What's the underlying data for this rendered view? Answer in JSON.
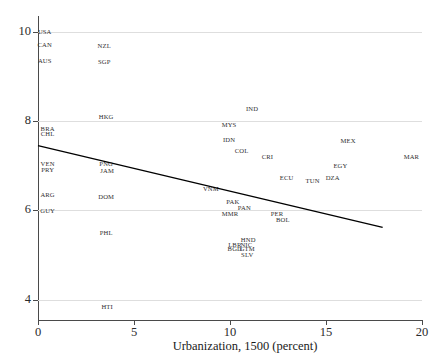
{
  "chart_data": {
    "type": "scatter",
    "title": "",
    "xlabel": "Urbanization, 1500 (percent)",
    "ylabel": "",
    "xlim": [
      0,
      20
    ],
    "ylim": [
      3.55,
      10.35
    ],
    "xticks": [
      0,
      5,
      10,
      15,
      20
    ],
    "yticks": [
      4,
      6,
      8,
      10
    ],
    "grid": true,
    "legend": "none",
    "point_label_field": "country_code",
    "points": [
      {
        "label": "USA",
        "x": 0.35,
        "y": 10.0
      },
      {
        "label": "CAN",
        "x": 0.35,
        "y": 9.7
      },
      {
        "label": "NZL",
        "x": 3.45,
        "y": 9.68
      },
      {
        "label": "AUS",
        "x": 0.35,
        "y": 9.35
      },
      {
        "label": "SGP",
        "x": 3.45,
        "y": 9.33
      },
      {
        "label": "IND",
        "x": 11.15,
        "y": 8.27
      },
      {
        "label": "HKG",
        "x": 3.55,
        "y": 8.1
      },
      {
        "label": "MYS",
        "x": 9.95,
        "y": 7.92
      },
      {
        "label": "BRA",
        "x": 0.5,
        "y": 7.83
      },
      {
        "label": "CHL",
        "x": 0.5,
        "y": 7.72
      },
      {
        "label": "IDN",
        "x": 9.95,
        "y": 7.58
      },
      {
        "label": "MEX",
        "x": 16.15,
        "y": 7.55
      },
      {
        "label": "COL",
        "x": 10.6,
        "y": 7.33
      },
      {
        "label": "CRI",
        "x": 11.95,
        "y": 7.2
      },
      {
        "label": "MAR",
        "x": 19.45,
        "y": 7.2
      },
      {
        "label": "VEN",
        "x": 0.5,
        "y": 7.05
      },
      {
        "label": "PNG",
        "x": 3.55,
        "y": 7.05
      },
      {
        "label": "EGY",
        "x": 15.75,
        "y": 7.0
      },
      {
        "label": "PRY",
        "x": 0.5,
        "y": 6.9
      },
      {
        "label": "JAM",
        "x": 3.6,
        "y": 6.88
      },
      {
        "label": "ECU",
        "x": 12.95,
        "y": 6.72
      },
      {
        "label": "DZA",
        "x": 15.35,
        "y": 6.72
      },
      {
        "label": "TUN",
        "x": 14.3,
        "y": 6.65
      },
      {
        "label": "VNM",
        "x": 9.0,
        "y": 6.47
      },
      {
        "label": "ARG",
        "x": 0.5,
        "y": 6.35
      },
      {
        "label": "DOM",
        "x": 3.55,
        "y": 6.3
      },
      {
        "label": "PAK",
        "x": 10.15,
        "y": 6.18
      },
      {
        "label": "PAN",
        "x": 10.75,
        "y": 6.05
      },
      {
        "label": "GUY",
        "x": 0.5,
        "y": 5.98
      },
      {
        "label": "MMR",
        "x": 10.0,
        "y": 5.93
      },
      {
        "label": "PER",
        "x": 12.45,
        "y": 5.93
      },
      {
        "label": "BOL",
        "x": 12.75,
        "y": 5.78
      },
      {
        "label": "PHL",
        "x": 3.55,
        "y": 5.5
      },
      {
        "label": "HND",
        "x": 10.95,
        "y": 5.33
      },
      {
        "label": "LBR",
        "x": 10.25,
        "y": 5.23
      },
      {
        "label": "NIC",
        "x": 10.85,
        "y": 5.23
      },
      {
        "label": "BGD",
        "x": 10.25,
        "y": 5.13
      },
      {
        "label": "GTM",
        "x": 10.9,
        "y": 5.13
      },
      {
        "label": "SLV",
        "x": 10.9,
        "y": 5.0
      },
      {
        "label": "HTI",
        "x": 3.6,
        "y": 3.85
      }
    ],
    "fit_line": {
      "name": "linear-fit",
      "x_start": 0.0,
      "y_start": 7.45,
      "x_end": 17.95,
      "y_end": 5.62,
      "color": "#000000"
    }
  }
}
